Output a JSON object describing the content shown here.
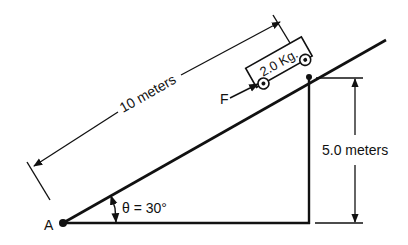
{
  "diagram": {
    "point_label": "A",
    "angle_label": "θ = 30°",
    "length_label": "10 meters",
    "height_label": "5.0 meters",
    "mass_label": "2.0 Kg.",
    "force_label": "F",
    "colors": {
      "ink": "#111111",
      "background": "#ffffff"
    }
  }
}
